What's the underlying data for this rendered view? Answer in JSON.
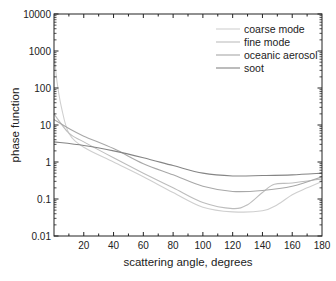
{
  "chart_data": {
    "type": "line",
    "title": "",
    "xlabel": "scattering angle, degrees",
    "ylabel": "phase function",
    "xlim": [
      0,
      180
    ],
    "ylim": [
      0.01,
      10000
    ],
    "yscale": "log",
    "grid": false,
    "legend_position": "upper right",
    "x_ticks": [
      20,
      40,
      60,
      80,
      100,
      120,
      140,
      160,
      180
    ],
    "x_tick_labels": [
      "20",
      "40",
      "60",
      "80",
      "100",
      "120",
      "140",
      "160",
      "180"
    ],
    "y_ticks": [
      0.01,
      0.1,
      1,
      10,
      100,
      1000,
      10000
    ],
    "y_tick_labels": [
      "0.01",
      "0.1",
      "1",
      "10",
      "100",
      "1000",
      "10000"
    ],
    "series": [
      {
        "name": "coarse mode",
        "color": "#cfcfcf",
        "x": [
          0.5,
          2,
          5,
          10,
          20,
          40,
          60,
          80,
          100,
          120,
          140,
          150,
          160,
          170,
          180
        ],
        "values": [
          600,
          150,
          30,
          6,
          2.5,
          1.0,
          0.4,
          0.15,
          0.06,
          0.045,
          0.048,
          0.07,
          0.13,
          0.2,
          0.3
        ]
      },
      {
        "name": "fine mode",
        "color": "#bdbdbd",
        "x": [
          0,
          10,
          20,
          40,
          60,
          80,
          100,
          120,
          130,
          140,
          148,
          160,
          180
        ],
        "values": [
          20,
          6,
          3.5,
          1.3,
          0.5,
          0.2,
          0.08,
          0.055,
          0.07,
          0.15,
          0.25,
          0.27,
          0.35
        ]
      },
      {
        "name": "oceanic aerosol",
        "color": "#a8a8a8",
        "x": [
          0,
          10,
          20,
          40,
          60,
          80,
          100,
          120,
          140,
          160,
          180
        ],
        "values": [
          14,
          8,
          5,
          2.3,
          0.9,
          0.45,
          0.22,
          0.16,
          0.17,
          0.22,
          0.4
        ]
      },
      {
        "name": "soot",
        "color": "#858585",
        "x": [
          0,
          20,
          40,
          60,
          80,
          100,
          120,
          140,
          160,
          180
        ],
        "values": [
          3.5,
          2.8,
          2.0,
          1.3,
          0.8,
          0.5,
          0.42,
          0.43,
          0.45,
          0.5
        ]
      }
    ]
  }
}
